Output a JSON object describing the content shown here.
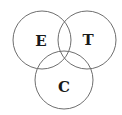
{
  "diagram": {
    "type": "venn",
    "sets": [
      {
        "id": "E",
        "label": "E",
        "cx": 42,
        "cy": 40,
        "r": 29
      },
      {
        "id": "T",
        "label": "T",
        "cx": 87,
        "cy": 40,
        "r": 29
      },
      {
        "id": "C",
        "label": "C",
        "cx": 64,
        "cy": 80,
        "r": 29
      }
    ],
    "stroke_color": "#6e6e6e",
    "label_color": "#1a1a1a"
  }
}
